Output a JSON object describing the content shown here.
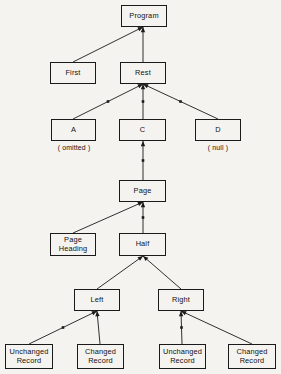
{
  "diagram": {
    "type": "tree",
    "background_color": "#f5f3ef",
    "line_color": "#1a1a1a",
    "text_color": "#111111",
    "nodes": [
      {
        "id": "program",
        "label": "Program",
        "x": 121,
        "y": 5,
        "w": 46,
        "h": 22
      },
      {
        "id": "first",
        "label": "First",
        "x": 50,
        "y": 62,
        "w": 46,
        "h": 22
      },
      {
        "id": "rest",
        "label": "Rest",
        "x": 120,
        "y": 62,
        "w": 46,
        "h": 22
      },
      {
        "id": "a",
        "label": "A",
        "x": 51,
        "y": 119,
        "w": 45,
        "h": 22
      },
      {
        "id": "c",
        "label": "C",
        "x": 119,
        "y": 119,
        "w": 47,
        "h": 22
      },
      {
        "id": "d",
        "label": "D",
        "x": 195,
        "y": 119,
        "w": 46,
        "h": 22
      },
      {
        "id": "page",
        "label": "Page",
        "x": 119,
        "y": 180,
        "w": 47,
        "h": 22
      },
      {
        "id": "page-heading",
        "label": "Page\nHeading",
        "x": 50,
        "y": 233,
        "w": 46,
        "h": 23
      },
      {
        "id": "half",
        "label": "Half",
        "x": 119,
        "y": 233,
        "w": 47,
        "h": 23
      },
      {
        "id": "left",
        "label": "Left",
        "x": 74,
        "y": 289,
        "w": 46,
        "h": 22
      },
      {
        "id": "right",
        "label": "Right",
        "x": 158,
        "y": 289,
        "w": 46,
        "h": 22
      },
      {
        "id": "unchanged-left",
        "label": "Unchanged\nRecord",
        "x": 5,
        "y": 344,
        "w": 48,
        "h": 25
      },
      {
        "id": "changed-left",
        "label": "Changed\nRecord",
        "x": 77,
        "y": 344,
        "w": 47,
        "h": 25
      },
      {
        "id": "unchanged-right",
        "label": "Unchanged\nRecord",
        "x": 159,
        "y": 344,
        "w": 47,
        "h": 25
      },
      {
        "id": "changed-right",
        "label": "Changed\nRecord",
        "x": 228,
        "y": 344,
        "w": 48,
        "h": 25
      }
    ],
    "annotations": [
      {
        "id": "omitted-note",
        "label": "( omitted )",
        "x": 45,
        "y": 144,
        "w": 58
      },
      {
        "id": "null-note",
        "label": "( null )",
        "x": 192,
        "y": 144,
        "w": 52
      }
    ],
    "edges": [
      {
        "id": "first-to-program",
        "from": "first",
        "to": "program",
        "x1": 73,
        "y1": 62,
        "x2": 143,
        "y2": 27,
        "tick": false
      },
      {
        "id": "rest-to-program",
        "from": "rest",
        "to": "program",
        "x1": 143,
        "y1": 62,
        "x2": 143,
        "y2": 27,
        "tick": false
      },
      {
        "id": "a-to-rest",
        "from": "a",
        "to": "rest",
        "x1": 73,
        "y1": 119,
        "x2": 143,
        "y2": 84,
        "tick": true
      },
      {
        "id": "c-to-rest",
        "from": "c",
        "to": "rest",
        "x1": 143,
        "y1": 119,
        "x2": 143,
        "y2": 84,
        "tick": true
      },
      {
        "id": "d-to-rest",
        "from": "d",
        "to": "rest",
        "x1": 218,
        "y1": 119,
        "x2": 143,
        "y2": 84,
        "tick": true
      },
      {
        "id": "page-to-c",
        "from": "page",
        "to": "c",
        "x1": 143,
        "y1": 180,
        "x2": 143,
        "y2": 141,
        "tick": true
      },
      {
        "id": "page-heading-to-page",
        "from": "page-heading",
        "to": "page",
        "x1": 73,
        "y1": 233,
        "x2": 143,
        "y2": 202,
        "tick": false
      },
      {
        "id": "half-to-page",
        "from": "half",
        "to": "page",
        "x1": 143,
        "y1": 233,
        "x2": 143,
        "y2": 202,
        "tick": true
      },
      {
        "id": "left-to-half",
        "from": "left",
        "to": "half",
        "x1": 97,
        "y1": 289,
        "x2": 143,
        "y2": 256,
        "tick": false
      },
      {
        "id": "right-to-half",
        "from": "right",
        "to": "half",
        "x1": 181,
        "y1": 289,
        "x2": 143,
        "y2": 256,
        "tick": false
      },
      {
        "id": "unchanged-left-to-left",
        "from": "unchanged-left",
        "to": "left",
        "x1": 29,
        "y1": 344,
        "x2": 97,
        "y2": 311,
        "tick": true
      },
      {
        "id": "changed-left-to-left",
        "from": "changed-left",
        "to": "left",
        "x1": 100,
        "y1": 344,
        "x2": 97,
        "y2": 311,
        "tick": false
      },
      {
        "id": "unchanged-right-to-right",
        "from": "unchanged-right",
        "to": "right",
        "x1": 182,
        "y1": 344,
        "x2": 181,
        "y2": 311,
        "tick": true
      },
      {
        "id": "changed-right-to-right",
        "from": "changed-right",
        "to": "right",
        "x1": 252,
        "y1": 344,
        "x2": 181,
        "y2": 311,
        "tick": false
      }
    ]
  }
}
